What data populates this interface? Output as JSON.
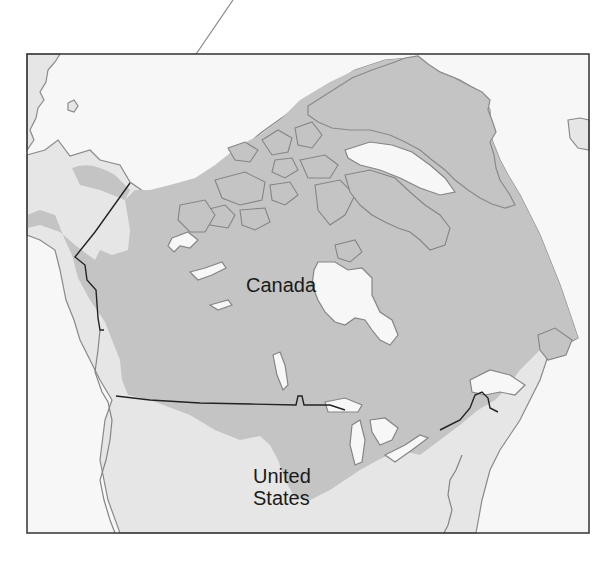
{
  "map": {
    "labels": {
      "canada": "Canada",
      "united_states_line1": "United",
      "united_states_line2": "States"
    },
    "legend": {
      "shaded_region": "Distribution range (dark gray)",
      "land": "Land (light gray)",
      "water": "Water (white)"
    },
    "colors": {
      "range_fill": "#c4c4c4",
      "land_fill": "#e6e6e6",
      "water_fill": "#f7f7f7",
      "coastline": "#858585",
      "border_line": "#222222",
      "frame": "#333333"
    }
  }
}
